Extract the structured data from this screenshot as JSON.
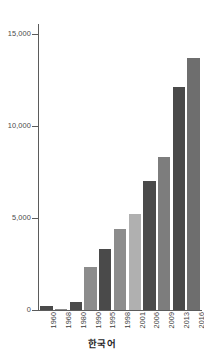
{
  "chart_data": {
    "type": "bar",
    "title": "",
    "subtitle": "",
    "caption": "한국어",
    "xlabel": "",
    "ylabel": "",
    "categories": [
      "1960",
      "1968",
      "1980",
      "1990",
      "1995",
      "1998",
      "2001",
      "2006",
      "2009",
      "2013",
      "2016"
    ],
    "values": [
      200,
      30,
      450,
      2400,
      3350,
      4500,
      5300,
      7150,
      8450,
      12300,
      13900
    ],
    "bar_colors": [
      "#4a4a4a",
      "#8c8c8c",
      "#4a4a4a",
      "#8c8c8c",
      "#4a4a4a",
      "#8c8c8c",
      "#b0b0b0",
      "#4a4a4a",
      "#7d7d7d",
      "#4a4a4a",
      "#6e6e6e"
    ],
    "ylim": [
      0,
      15800
    ],
    "yticks": [
      0,
      5000,
      10000,
      15000
    ],
    "ytick_labels": [
      "0",
      "5,000",
      "10,000",
      "15,000"
    ],
    "grid": false,
    "legend": null,
    "axis_color": "#5b5b5b"
  },
  "axis": {
    "y_labels": [
      {
        "value": 15000,
        "text": "15,000"
      },
      {
        "value": 10000,
        "text": "10,000"
      },
      {
        "value": 5000,
        "text": "5,000"
      },
      {
        "value": 0,
        "text": "0"
      }
    ]
  }
}
